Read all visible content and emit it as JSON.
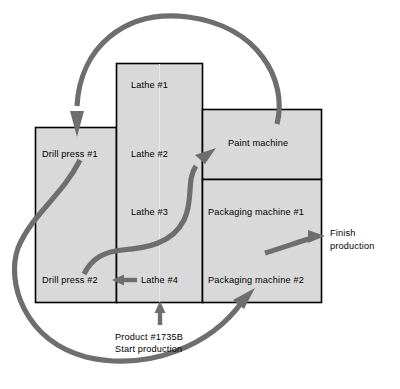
{
  "diagram": {
    "colors": {
      "machine_fill": "#d9d9d9",
      "machine_stroke": "#000000",
      "arrow": "#6e6e6e",
      "background": "#ffffff"
    },
    "machines": [
      {
        "id": "drill-press-1",
        "label": "Drill press #1"
      },
      {
        "id": "drill-press-2",
        "label": "Drill press #2"
      },
      {
        "id": "lathe-1",
        "label": "Lathe #1"
      },
      {
        "id": "lathe-2",
        "label": "Lathe #2"
      },
      {
        "id": "lathe-3",
        "label": "Lathe #3"
      },
      {
        "id": "lathe-4",
        "label": "Lathe #4"
      },
      {
        "id": "paint-machine",
        "label": "Paint machine"
      },
      {
        "id": "packaging-machine-1",
        "label": "Packaging machine #1"
      },
      {
        "id": "packaging-machine-2",
        "label": "Packaging machine #2"
      }
    ],
    "annotations": [
      {
        "id": "start-production",
        "line1": "Product #1735B",
        "line2": "Start production"
      },
      {
        "id": "finish-production",
        "line1": "Finish",
        "line2": "production"
      }
    ],
    "flows": [
      {
        "id": "flow-start-to-lathe4",
        "from": "Start production",
        "to": "Lathe #4"
      },
      {
        "id": "flow-lathe4-to-drill2",
        "from": "Lathe #4",
        "to": "Drill press #2"
      },
      {
        "id": "flow-drill2-to-paint",
        "from": "Drill press #2",
        "to": "Paint machine"
      },
      {
        "id": "flow-paint-to-drill1",
        "from": "Paint machine",
        "to": "Drill press #1"
      },
      {
        "id": "flow-drill1-to-packaging2",
        "from": "Drill press #1",
        "to": "Packaging machine #2"
      },
      {
        "id": "flow-packaging-to-finish",
        "from": "Packaging machine #2",
        "to": "Finish production"
      }
    ]
  }
}
